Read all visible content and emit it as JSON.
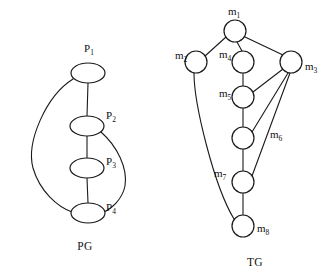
{
  "figure": {
    "background_color": "#ffffff",
    "stroke_color": "#1a1a1a"
  },
  "graphs": [
    {
      "id": "pg",
      "caption": "PG",
      "caption_pos": {
        "x": 85,
        "y": 250
      },
      "node_shape": "ellipse",
      "nodes": [
        {
          "id": "P1",
          "label_main": "P",
          "label_sub": "1",
          "cx": 88,
          "cy": 73,
          "rx": 17,
          "ry": 10,
          "label_x": 84,
          "label_y": 52
        },
        {
          "id": "P2",
          "label_main": "P",
          "label_sub": "2",
          "cx": 87,
          "cy": 126,
          "rx": 17,
          "ry": 10,
          "label_x": 106,
          "label_y": 119
        },
        {
          "id": "P3",
          "label_main": "P",
          "label_sub": "3",
          "cx": 87,
          "cy": 168,
          "rx": 17,
          "ry": 10,
          "label_x": 106,
          "label_y": 165
        },
        {
          "id": "P4",
          "label_main": "P",
          "label_sub": "4",
          "cx": 88,
          "cy": 213,
          "rx": 17,
          "ry": 10,
          "label_x": 106,
          "label_y": 211
        }
      ],
      "edges": [
        {
          "id": "P1-P2",
          "from": "P1",
          "to": "P2",
          "kind": "line",
          "path": "M 88 83 L 87 116"
        },
        {
          "id": "P2-P3",
          "from": "P2",
          "to": "P3",
          "kind": "line",
          "path": "M 87 136 L 87 158"
        },
        {
          "id": "P3-P4",
          "from": "P3",
          "to": "P4",
          "kind": "line",
          "path": "M 87 178 L 88 203"
        },
        {
          "id": "P1-P4",
          "from": "P1",
          "to": "P4",
          "kind": "curve",
          "path": "M 73 79 C 46 96, 26 142, 33 168 C 40 192, 58 207, 72 212"
        },
        {
          "id": "P2-P4",
          "from": "P2",
          "to": "P4",
          "kind": "curve",
          "path": "M 101 132 C 117 146, 128 168, 125 186 C 122 200, 111 209, 104 212"
        }
      ]
    },
    {
      "id": "tg",
      "caption": "TG",
      "caption_pos": {
        "x": 255,
        "y": 266
      },
      "node_shape": "circle",
      "nodes": [
        {
          "id": "m1",
          "label_main": "m",
          "label_sub": "1",
          "cx": 235,
          "cy": 31,
          "r": 11,
          "label_x": 228,
          "label_y": 15
        },
        {
          "id": "m2",
          "label_main": "m",
          "label_sub": "2",
          "cx": 196,
          "cy": 62,
          "r": 11,
          "label_x": 175,
          "label_y": 59
        },
        {
          "id": "m3",
          "label_main": "m",
          "label_sub": "3",
          "cx": 291,
          "cy": 62,
          "r": 11,
          "label_x": 305,
          "label_y": 70
        },
        {
          "id": "m4",
          "label_main": "m",
          "label_sub": "4",
          "cx": 243,
          "cy": 62,
          "r": 11,
          "label_x": 219,
          "label_y": 58
        },
        {
          "id": "m5",
          "label_main": "m",
          "label_sub": "5",
          "cx": 243,
          "cy": 97,
          "r": 11,
          "label_x": 219,
          "label_y": 97
        },
        {
          "id": "m6",
          "label_main": "m",
          "label_sub": "6",
          "cx": 243,
          "cy": 138,
          "r": 11,
          "label_x": 270,
          "label_y": 138
        },
        {
          "id": "m7",
          "label_main": "m",
          "label_sub": "7",
          "cx": 243,
          "cy": 182,
          "r": 11,
          "label_x": 214,
          "label_y": 177
        },
        {
          "id": "m8",
          "label_main": "m",
          "label_sub": "8",
          "cx": 243,
          "cy": 226,
          "r": 11,
          "label_x": 257,
          "label_y": 232
        }
      ],
      "edges": [
        {
          "id": "m1-m2",
          "from": "m1",
          "to": "m2",
          "kind": "line",
          "path": "M 226 37 L 205 56"
        },
        {
          "id": "m1-m4",
          "from": "m1",
          "to": "m4",
          "kind": "line",
          "path": "M 237 42 L 242 51"
        },
        {
          "id": "m1-m3",
          "from": "m1",
          "to": "m3",
          "kind": "line",
          "path": "M 245 37 L 283 55"
        },
        {
          "id": "m4-m5",
          "from": "m4",
          "to": "m5",
          "kind": "line",
          "path": "M 243 73 L 243 86"
        },
        {
          "id": "m5-m3",
          "from": "m5",
          "to": "m3",
          "kind": "line",
          "path": "M 253 92 L 283 69"
        },
        {
          "id": "m5-m6",
          "from": "m5",
          "to": "m6",
          "kind": "line",
          "path": "M 243 108 L 243 127"
        },
        {
          "id": "m6-m3",
          "from": "m6",
          "to": "m3",
          "kind": "line",
          "path": "M 252 132 L 288 73"
        },
        {
          "id": "m6-m7",
          "from": "m6",
          "to": "m7",
          "kind": "line",
          "path": "M 243 149 L 243 171"
        },
        {
          "id": "m7-m3",
          "from": "m7",
          "to": "m3",
          "kind": "line",
          "path": "M 252 176 L 290 73"
        },
        {
          "id": "m7-m8",
          "from": "m7",
          "to": "m8",
          "kind": "line",
          "path": "M 243 193 L 243 215"
        },
        {
          "id": "m2-m8",
          "from": "m2",
          "to": "m8",
          "kind": "curve",
          "path": "M 194 73 C 194 104, 214 186, 234 219"
        }
      ]
    }
  ]
}
